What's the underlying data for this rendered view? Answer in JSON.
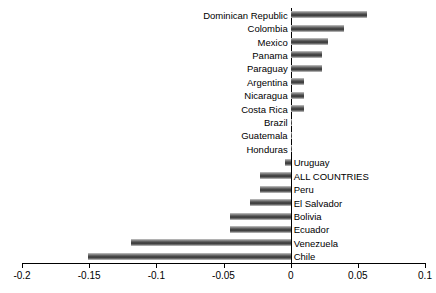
{
  "chart_data": {
    "type": "bar",
    "orientation": "horizontal",
    "title": "",
    "subtitle": "",
    "xlabel": "",
    "ylabel": "",
    "xlim": [
      -0.2,
      0.1
    ],
    "xticks": [
      -0.2,
      -0.15,
      -0.1,
      -0.05,
      0,
      0.05,
      0.1
    ],
    "xtick_labels": [
      "-0.2",
      "-0.15",
      "-0.1",
      "-0.05",
      "0",
      "0.05",
      "0.1"
    ],
    "grid": false,
    "legend": null,
    "bar_color": "#4a4a4a",
    "axis_color": "#000000",
    "categories": [
      "Dominican Republic",
      "Colombia",
      "Mexico",
      "Panama",
      "Paraguay",
      "Argentina",
      "Nicaragua",
      "Costa Rica",
      "Brazil",
      "Guatemala",
      "Honduras",
      "Uruguay",
      "ALL COUNTRIES",
      "Peru",
      "El Salvador",
      "Bolivia",
      "Ecuador",
      "Venezuela",
      "Chile"
    ],
    "values": [
      0.057,
      0.04,
      0.028,
      0.023,
      0.023,
      0.01,
      0.01,
      0.01,
      0.001,
      0.001,
      0.001,
      -0.004,
      -0.023,
      -0.023,
      -0.03,
      -0.045,
      -0.045,
      -0.119,
      -0.151
    ]
  }
}
